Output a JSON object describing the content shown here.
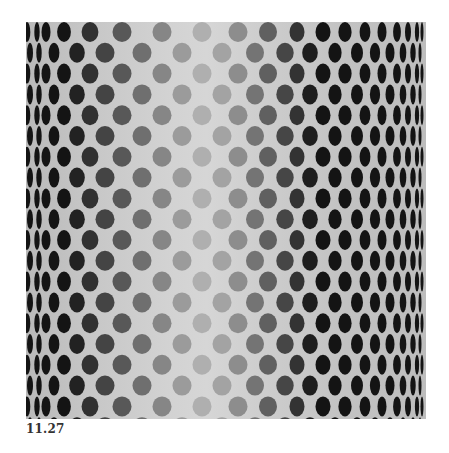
{
  "figure": {
    "caption": "11.27"
  },
  "pattern": {
    "panel": {
      "x": 26,
      "y": 22,
      "width": 400,
      "height": 397
    },
    "row_y_start": 10,
    "row_pitch": 20.8,
    "row_count": 20,
    "dot_height": 20,
    "row_type_a_x": [
      1,
      11,
      20,
      38,
      64,
      96,
      136,
      176,
      212,
      242,
      271,
      297,
      319,
      339,
      356,
      371,
      382,
      391,
      396
    ],
    "row_type_b_x": [
      4,
      13,
      28,
      51,
      79,
      116,
      156,
      196,
      229,
      259,
      284,
      309,
      331,
      349,
      364,
      377,
      387,
      394
    ],
    "colors": {
      "edge_dot": "#141414",
      "center_dot": "#b4b4b4",
      "background_center": "#d6d6d6",
      "background_edge": "#bababa"
    }
  }
}
